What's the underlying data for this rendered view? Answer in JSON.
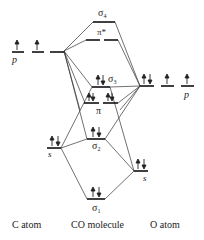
{
  "diagram": {
    "columns": {
      "left": "C atom",
      "center": "CO molecule",
      "right": "O atom"
    },
    "levels": {
      "sigma4": {
        "label": "σ",
        "sub": "4",
        "electrons": ""
      },
      "pi_star": {
        "label": "π*",
        "electrons": ""
      },
      "sigma3": {
        "label": "σ",
        "sub": "3",
        "electrons": "↑↓"
      },
      "pi": {
        "label": "π",
        "electrons": "↑↓ ↑↓"
      },
      "sigma2": {
        "label": "σ",
        "sub": "2",
        "electrons": "↑↓"
      },
      "sigma1": {
        "label": "σ",
        "sub": "1",
        "electrons": "↑↓"
      },
      "c_p": {
        "label": "p",
        "electrons": "↑ ↑ (empty)"
      },
      "c_s": {
        "label": "s",
        "electrons": "↑↓"
      },
      "o_p": {
        "label": "p",
        "electrons": "↑↓ ↑ ↑"
      },
      "o_s": {
        "label": "s",
        "electrons": "↑↓"
      }
    }
  }
}
